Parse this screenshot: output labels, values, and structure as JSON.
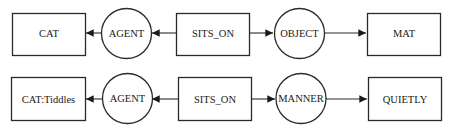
{
  "diagram": {
    "type": "conceptual-graph",
    "rows": [
      {
        "nodes": [
          {
            "id": "r1-cat",
            "shape": "box",
            "label": "CAT"
          },
          {
            "id": "r1-agent",
            "shape": "circle",
            "label": "AGENT"
          },
          {
            "id": "r1-sits",
            "shape": "box",
            "label": "SITS_ON"
          },
          {
            "id": "r1-object",
            "shape": "circle",
            "label": "OBJECT"
          },
          {
            "id": "r1-mat",
            "shape": "box",
            "label": "MAT"
          }
        ],
        "edges": [
          {
            "from": "r1-sits",
            "to": "r1-agent"
          },
          {
            "from": "r1-agent",
            "to": "r1-cat"
          },
          {
            "from": "r1-sits",
            "to": "r1-object"
          },
          {
            "from": "r1-object",
            "to": "r1-mat"
          }
        ]
      },
      {
        "nodes": [
          {
            "id": "r2-cat",
            "shape": "box",
            "label": "CAT:Tiddles"
          },
          {
            "id": "r2-agent",
            "shape": "circle",
            "label": "AGENT"
          },
          {
            "id": "r2-sits",
            "shape": "box",
            "label": "SITS_ON"
          },
          {
            "id": "r2-manner",
            "shape": "circle",
            "label": "MANNER"
          },
          {
            "id": "r2-quietly",
            "shape": "box",
            "label": "QUIETLY"
          }
        ],
        "edges": [
          {
            "from": "r2-sits",
            "to": "r2-agent"
          },
          {
            "from": "r2-agent",
            "to": "r2-cat"
          },
          {
            "from": "r2-sits",
            "to": "r2-manner"
          },
          {
            "from": "r2-manner",
            "to": "r2-quietly"
          }
        ]
      }
    ]
  }
}
